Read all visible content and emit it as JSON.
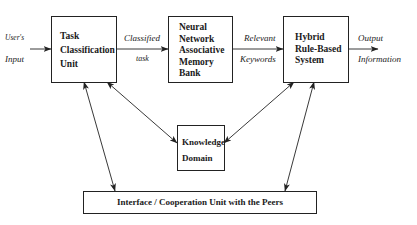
{
  "diagram": {
    "boxes": {
      "task_classification": {
        "label": "Task\nClassification\nUnit"
      },
      "neural_network": {
        "label": "Neural\nNetwork\nAssociative\nMemory\nBank"
      },
      "hybrid_system": {
        "label": "Hybrid\nRule-Based\nSystem"
      },
      "knowledge_domain": {
        "label": "Knowledge\nDomain"
      },
      "interface_unit": {
        "label": "Interface / Cooperation Unit with the Peers"
      }
    },
    "edge_labels": {
      "user_input_top": "User's",
      "user_input_bottom": "Input",
      "classified_top": "Classified",
      "classified_bottom": "task",
      "relevant_top": "Relevant",
      "relevant_bottom": "Keywords",
      "output_top": "Output",
      "output_bottom": "Information"
    },
    "colors": {
      "line": "#222222",
      "background": "#ffffff"
    }
  }
}
